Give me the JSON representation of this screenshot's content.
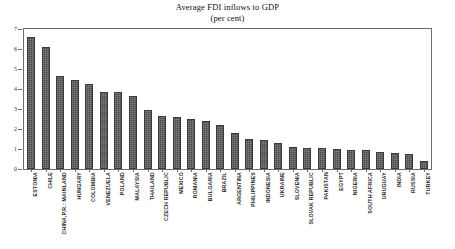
{
  "chart_data": {
    "type": "bar",
    "title": "Average FDI inflows to GDP",
    "subtitle": "(per cent)",
    "xlabel": "",
    "ylabel": "",
    "ylim": [
      0,
      7
    ],
    "yticks": [
      0,
      1,
      2,
      3,
      4,
      5,
      6,
      7
    ],
    "grid": false,
    "legend": false,
    "orientation": "vertical",
    "bar_color": "#4b4b4b",
    "categories": [
      "ESTONIA",
      "CHILE",
      "CHINA,P.R.: MAINLAND",
      "HUNGARY",
      "COLOMBIA",
      "VENEZUELA",
      "POLAND",
      "MALAYSIA",
      "THAILAND",
      "CZECH REPUBLIC",
      "MEXICO",
      "ROMANIA",
      "BULGARIA",
      "BRAZIL",
      "ARGENTINA",
      "PHILIPPINES",
      "INDONESIA",
      "UKRAINE",
      "SLOVENIA",
      "SLOVAK REPUBLIC",
      "PAKISTAN",
      "EGYPT",
      "NIGERIA",
      "SOUTH AFRICA",
      "URUGUAY",
      "INDIA",
      "RUSSIA",
      "TURKEY"
    ],
    "values": [
      6.6,
      6.1,
      4.65,
      4.45,
      4.25,
      3.85,
      3.85,
      3.65,
      2.95,
      2.65,
      2.6,
      2.5,
      2.4,
      2.2,
      1.8,
      1.5,
      1.45,
      1.3,
      1.1,
      1.05,
      1.05,
      1.0,
      0.95,
      0.95,
      0.85,
      0.8,
      0.75,
      0.4
    ]
  }
}
